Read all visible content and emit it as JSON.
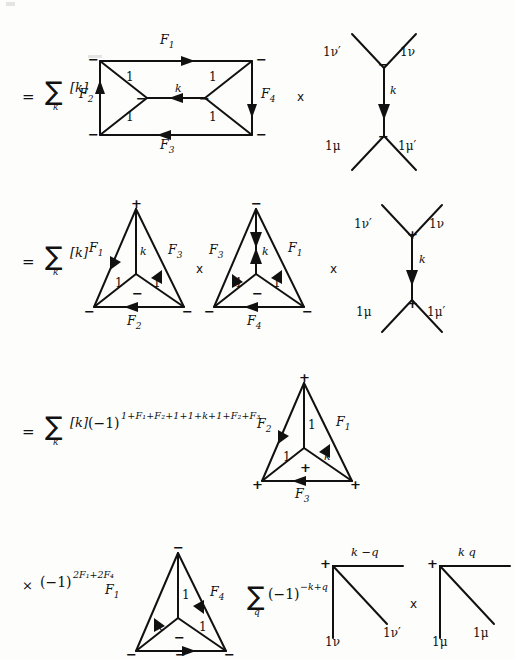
{
  "page": {
    "background": "#fdfdfc",
    "ink": "#111111",
    "width": 486,
    "height": 648
  },
  "artifacts": [
    {
      "name": "scan-speck-top-left",
      "x": 6,
      "y": 2,
      "w": 9,
      "h": 4
    },
    {
      "name": "scan-speck-top-mid",
      "x": 88,
      "y": 55,
      "w": 14,
      "h": 3
    }
  ],
  "rows": [
    {
      "id": "row1",
      "prefix": {
        "equals": "=",
        "sum_glyph": "∑",
        "sum_index": "k",
        "bracket": "[k]"
      },
      "diagrams": [
        {
          "name": "double-theta-rectangle",
          "type": "rectangle-bowtie",
          "corner_signs": [
            "−",
            "−",
            "−",
            "−"
          ],
          "vertex_signs": [
            "−",
            "−"
          ],
          "edge_labels": {
            "top": "F",
            "top_sub": "1",
            "bottom": "F",
            "bottom_sub": "3",
            "left": "F",
            "left_sub": "2",
            "right": "F",
            "right_sub": "4",
            "middle": "k"
          },
          "inner_labels": [
            "1",
            "1",
            "1",
            "1"
          ],
          "arrows": {
            "top": "right",
            "bottom": "left",
            "left": "up",
            "right": "down",
            "middle": "left"
          }
        },
        {
          "name": "vertical-k-propagator",
          "type": "H-vertex",
          "top_left": "1ν′",
          "top_right": "1ν",
          "bottom_left": "1μ",
          "bottom_right": "1μ′",
          "top_sign": "−",
          "bottom_sign": "−",
          "middle_label": "k",
          "middle_arrow": "down"
        }
      ],
      "operators": [
        "x"
      ]
    },
    {
      "id": "row2",
      "prefix": {
        "equals": "=",
        "sum_glyph": "∑",
        "sum_index": "k",
        "bracket": "[k]"
      },
      "diagrams": [
        {
          "name": "triangle-left",
          "type": "triangle-tripod",
          "apex_sign": "+",
          "left_sign": "−",
          "right_sign": "−",
          "center_sign": "−",
          "left_edge": "F",
          "left_sub": "1",
          "right_edge": "F",
          "right_sub": "3",
          "bottom_edge": "F",
          "bottom_sub": "2",
          "spoke_label": "k",
          "inner_labels": [
            "1",
            "1"
          ],
          "arrows": {
            "left": "up",
            "right": "down",
            "bottom": "left",
            "spoke": "none"
          }
        },
        {
          "name": "triangle-middle",
          "type": "triangle-tripod",
          "apex_sign": "−",
          "left_sign": "−",
          "right_sign": "−",
          "center_sign": "−",
          "left_edge": "F",
          "left_sub": "3",
          "right_edge": "F",
          "right_sub": "1",
          "bottom_edge": "F",
          "bottom_sub": "4",
          "spoke_label": "k",
          "inner_labels": [
            "1",
            "1"
          ],
          "arrows": {
            "left": "down",
            "right": "down",
            "bottom": "left",
            "spoke": "double"
          }
        },
        {
          "name": "vertical-k-propagator-plus",
          "type": "H-vertex",
          "top_left": "1ν′",
          "top_right": "1ν",
          "bottom_left": "1μ",
          "bottom_right": "1μ′",
          "top_sign": "+",
          "bottom_sign": "+",
          "middle_label": "k",
          "middle_arrow": "down"
        }
      ],
      "operators": [
        "x",
        "x"
      ]
    },
    {
      "id": "row3",
      "prefix": {
        "equals": "=",
        "sum_glyph": "∑",
        "sum_index": "k",
        "bracket": "[k]",
        "phase_base": "(−1)",
        "phase_exponent": "1+F₁+F₂+1+1+k+1+F₂+F₃"
      },
      "diagrams": [
        {
          "name": "triangle-plus",
          "type": "triangle-tripod",
          "apex_sign": "+",
          "left_sign": "+",
          "right_sign": "+",
          "center_sign": "+",
          "left_edge": "F",
          "left_sub": "2",
          "right_edge": "F",
          "right_sub": "1",
          "bottom_edge": "F",
          "bottom_sub": "3",
          "spoke_label": "1",
          "inner_labels": [
            "1",
            "k"
          ],
          "arrows": {
            "left": "up",
            "right": "down",
            "bottom": "left",
            "spoke": "none"
          }
        }
      ],
      "operators": []
    },
    {
      "id": "row4",
      "prefix": {
        "times": "×",
        "phase_base": "(−1)",
        "phase_exponent": "2F₁+2F₄"
      },
      "diagrams": [
        {
          "name": "triangle-minus-bottom",
          "type": "triangle-tripod",
          "apex_sign": "−",
          "left_sign": "−",
          "right_sign": "−",
          "center_sign": "−",
          "bottom_mid_sign": "−",
          "left_edge": "F",
          "left_sub": "1",
          "right_edge": "F",
          "right_sub": "4",
          "bottom_edge": "",
          "spoke_label": "1",
          "inner_labels": [
            "k",
            "1"
          ],
          "arrows": {
            "left": "down",
            "right": "up",
            "bottom": "right",
            "spoke": "none"
          }
        },
        {
          "name": "corner-vertex-nu",
          "type": "corner-vertex",
          "sign": "+",
          "top_label": "k −q",
          "leg_label": "1ν",
          "diag_label": "1ν′"
        },
        {
          "name": "corner-vertex-mu",
          "type": "corner-vertex",
          "sign": "+",
          "top_label": "k q",
          "leg_label": "1μ",
          "diag_label": "1μ"
        }
      ],
      "sum_q": {
        "sum_glyph": "∑",
        "index": "q",
        "phase_base": "(−1)",
        "phase_exponent": "−k+q"
      },
      "operators": [
        "x"
      ]
    }
  ]
}
